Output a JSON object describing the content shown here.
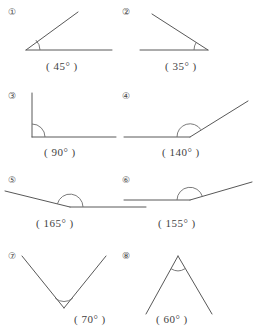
{
  "worksheet": {
    "title": "Angle measurement worksheet",
    "items": [
      {
        "marker": "①",
        "label": "( 45° )",
        "angle_value": "45°",
        "shape": "acute-angle-open-right"
      },
      {
        "marker": "②",
        "label": "( 35° )",
        "angle_value": "35°",
        "shape": "acute-angle-open-left"
      },
      {
        "marker": "③",
        "label": "( 90° )",
        "angle_value": "90°",
        "shape": "right-angle"
      },
      {
        "marker": "④",
        "label": "( 140° )",
        "angle_value": "140°",
        "shape": "obtuse-angle"
      },
      {
        "marker": "⑤",
        "label": "( 165° )",
        "angle_value": "165°",
        "shape": "reflexive-wide-angle"
      },
      {
        "marker": "⑥",
        "label": "( 155° )",
        "angle_value": "155°",
        "shape": "wide-obtuse-angle"
      },
      {
        "marker": "⑦",
        "label": "( 70° )",
        "angle_value": "70°",
        "shape": "v-shape-vertex-bottom"
      },
      {
        "marker": "⑧",
        "label": "( 60° )",
        "angle_value": "60°",
        "shape": "lambda-shape-vertex-top"
      }
    ],
    "colors": {
      "ray": "#585858",
      "arc": "#6b6b6b",
      "text": "#3f3f3f",
      "background": "#ffffff"
    }
  }
}
